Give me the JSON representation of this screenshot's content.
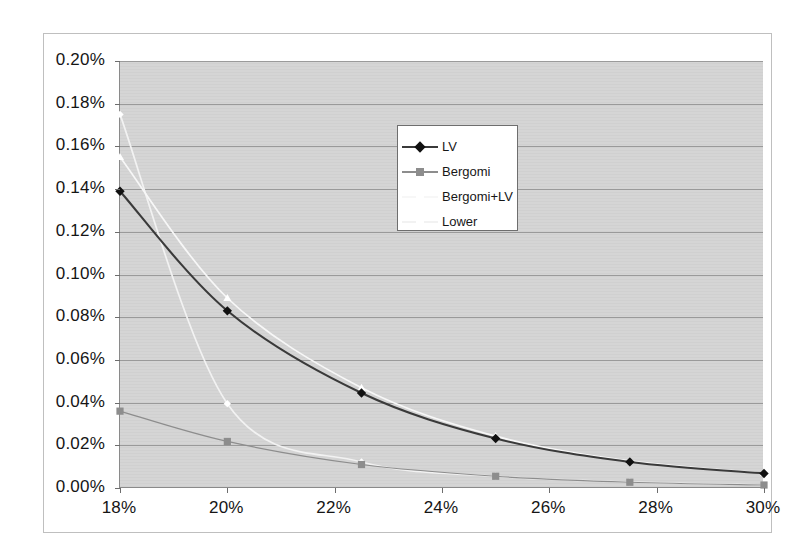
{
  "chart_data": {
    "type": "line",
    "title": "",
    "xlabel": "",
    "ylabel": "",
    "xlim": [
      18,
      30
    ],
    "ylim": [
      0,
      0.2
    ],
    "grid": true,
    "legend_position": "inside-upper-center",
    "x_ticklabels": [
      "18%",
      "20%",
      "22%",
      "24%",
      "26%",
      "28%",
      "30%"
    ],
    "x_tickvalues": [
      18,
      20,
      22,
      24,
      26,
      28,
      30
    ],
    "y_ticklabels": [
      "0.20%",
      "0.18%",
      "0.16%",
      "0.14%",
      "0.12%",
      "0.10%",
      "0.08%",
      "0.06%",
      "0.04%",
      "0.02%",
      "0.00%"
    ],
    "y_tickvalues": [
      0.2,
      0.18,
      0.16,
      0.14,
      0.12,
      0.1,
      0.08,
      0.06,
      0.04,
      0.02,
      0.0
    ],
    "x": [
      18,
      20,
      22.5,
      25,
      27.5,
      30
    ],
    "series": [
      {
        "name": "LV",
        "color": "#3a3a3a",
        "marker": "diamond",
        "marker_color": "#111111",
        "values": [
          0.139,
          0.083,
          0.0445,
          0.0232,
          0.0122,
          0.0068
        ]
      },
      {
        "name": "Bergomi",
        "color": "#8d8d8d",
        "marker": "square",
        "marker_color": "#8d8d8d",
        "values": [
          0.036,
          0.0218,
          0.011,
          0.0055,
          0.0027,
          0.0014
        ]
      },
      {
        "name": "Bergomi+LV",
        "color": "#f7f7f7",
        "marker": "triangle",
        "marker_color": "#ffffff",
        "values": [
          0.155,
          0.089,
          0.047,
          0.0243,
          0.0127,
          0.007
        ]
      },
      {
        "name": "Lower",
        "color": "#f2f2f2",
        "marker": "cross",
        "marker_color": "#ffffff",
        "values": [
          0.175,
          0.0395,
          0.0122,
          0.0055,
          0.0028,
          0.0015
        ]
      }
    ]
  },
  "legend": {
    "entries": [
      {
        "label": "LV"
      },
      {
        "label": "Bergomi"
      },
      {
        "label": "Bergomi+LV"
      },
      {
        "label": "Lower"
      }
    ]
  },
  "style": {
    "plot_background": "#d5d5d5",
    "page_background": "#ffffff",
    "gridline_color": "#9a9a9a",
    "axis_color": "#8a8a8a"
  }
}
